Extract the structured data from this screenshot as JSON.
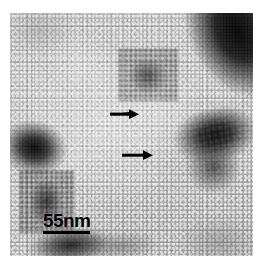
{
  "figure": {
    "type": "electron-micrograph",
    "modality": "transmission electron microscopy, negative stain",
    "panel": {
      "left": 10,
      "top": 13,
      "width": 243,
      "height": 243
    },
    "background_color": "#ffffff",
    "field_color": "#b6b6b6"
  },
  "scale_bar": {
    "label": "55nm",
    "value": 55,
    "unit": "nm",
    "bar_length_px": 47,
    "color": "#000000",
    "position": "bottom-left"
  },
  "annotations": {
    "arrow_color": "#000000",
    "arrows": [
      {
        "name": "arrow-upper",
        "direction": "right",
        "tip_x": 130,
        "tip_y": 101,
        "length_px": 30
      },
      {
        "name": "arrow-lower",
        "direction": "right",
        "tip_x": 144,
        "tip_y": 142,
        "length_px": 32
      }
    ]
  },
  "features": {
    "deposits": [
      {
        "name": "deposit-top-right-band",
        "description": "dark stain band entering from the top-right corner"
      },
      {
        "name": "deposit-right-wedge",
        "description": "large dark stain aggregate at the right middle edge"
      },
      {
        "name": "deposit-left-wedge",
        "description": "dark stain wedge at the left middle edge"
      },
      {
        "name": "deposit-lower-left-aggregate",
        "description": "granular dark aggregate at the lower left"
      },
      {
        "name": "deposit-top-centre-cluster",
        "description": "particulate cluster near the top centre"
      },
      {
        "name": "deposit-bottom-smear",
        "description": "dark smear along the bottom edge"
      },
      {
        "name": "deposit-bottom-right-shade",
        "description": "faint darkening at the bottom right"
      },
      {
        "name": "deposit-top-left-shade",
        "description": "faint darkening at the top left"
      }
    ],
    "texture": "dense fine granular particles of uniform size filling the field"
  }
}
